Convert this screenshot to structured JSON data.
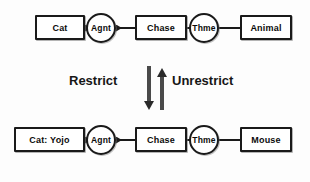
{
  "diagram": {
    "type": "conceptual-graph",
    "title": "",
    "background_color": "#fdfdfd",
    "stroke_color": "#1a1a1a",
    "text_color": "#0b0b0b",
    "rows": [
      {
        "id": "generic-row",
        "nodes": [
          {
            "id": "cat",
            "label": "Cat",
            "shape": "box"
          },
          {
            "id": "agnt1",
            "label": "Agnt",
            "shape": "circle"
          },
          {
            "id": "chase1",
            "label": "Chase",
            "shape": "box"
          },
          {
            "id": "thme1",
            "label": "Thme",
            "shape": "circle"
          },
          {
            "id": "animal",
            "label": "Animal",
            "shape": "box"
          }
        ],
        "edges": [
          {
            "from": "agnt1",
            "to": "cat",
            "direction": "left"
          },
          {
            "from": "chase1",
            "to": "agnt1",
            "direction": "left"
          },
          {
            "from": "chase1",
            "to": "thme1",
            "direction": "right"
          },
          {
            "from": "thme1",
            "to": "animal",
            "direction": "right"
          }
        ]
      },
      {
        "id": "specific-row",
        "nodes": [
          {
            "id": "catyojo",
            "label": "Cat: Yojo",
            "shape": "box"
          },
          {
            "id": "agnt2",
            "label": "Agnt",
            "shape": "circle"
          },
          {
            "id": "chase2",
            "label": "Chase",
            "shape": "box"
          },
          {
            "id": "thme2",
            "label": "Thme",
            "shape": "circle"
          },
          {
            "id": "mouse",
            "label": "Mouse",
            "shape": "box"
          }
        ],
        "edges": [
          {
            "from": "agnt2",
            "to": "catyojo",
            "direction": "left"
          },
          {
            "from": "chase2",
            "to": "agnt2",
            "direction": "left"
          },
          {
            "from": "chase2",
            "to": "thme2",
            "direction": "right"
          },
          {
            "from": "thme2",
            "to": "mouse",
            "direction": "right"
          }
        ]
      }
    ],
    "transition": {
      "left_label": "Restrict",
      "right_label": "Unrestrict",
      "down_arrow_name": "restrict-arrow-down",
      "up_arrow_name": "unrestrict-arrow-up"
    }
  }
}
